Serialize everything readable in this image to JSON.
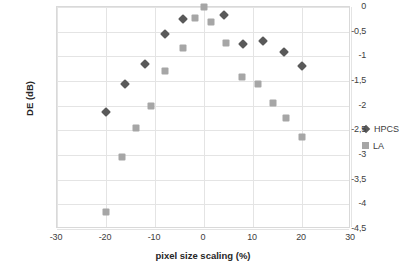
{
  "chart_data": {
    "type": "scatter",
    "title": "",
    "xlabel": "pixel size scaling  (%)",
    "ylabel": "DE (dB)",
    "xlim": [
      -30,
      30
    ],
    "ylim": [
      -4.5,
      0
    ],
    "grid": true,
    "legend_position": "right",
    "x_ticks": [
      "-30",
      "-20",
      "-10",
      "0",
      "10",
      "20",
      "30"
    ],
    "x_tick_values": [
      -30,
      -20,
      -10,
      0,
      10,
      20,
      30
    ],
    "y_ticks": [
      "0",
      "-0,5",
      "-1",
      "-1,5",
      "-2",
      "-2,5",
      "-3",
      "-3,5",
      "-4",
      "-4,5"
    ],
    "y_tick_values": [
      0,
      -0.5,
      -1,
      -1.5,
      -2,
      -2.5,
      -3,
      -3.5,
      -4,
      -4.5
    ],
    "series": [
      {
        "name": "HPCS",
        "marker": "diamond",
        "color": "#595959",
        "points": [
          [
            -20.0,
            -2.13
          ],
          [
            -16.2,
            -1.57
          ],
          [
            -12.0,
            -1.16
          ],
          [
            -8.0,
            -0.55
          ],
          [
            -4.2,
            -0.25
          ],
          [
            4.0,
            -0.17
          ],
          [
            8.0,
            -0.75
          ],
          [
            12.0,
            -0.68
          ],
          [
            16.3,
            -0.92
          ],
          [
            20.0,
            -1.2
          ]
        ]
      },
      {
        "name": "LA",
        "marker": "square",
        "color": "#a6a6a6",
        "points": [
          [
            -20.0,
            -4.15
          ],
          [
            -16.8,
            -3.05
          ],
          [
            -13.8,
            -2.46
          ],
          [
            -10.8,
            -2.0
          ],
          [
            -8.0,
            -1.3
          ],
          [
            -4.3,
            -0.84
          ],
          [
            -1.8,
            -0.23
          ],
          [
            0.0,
            0.0
          ],
          [
            1.5,
            -0.3
          ],
          [
            4.5,
            -0.73
          ],
          [
            7.8,
            -1.42
          ],
          [
            11.0,
            -1.57
          ],
          [
            14.0,
            -1.94
          ],
          [
            16.8,
            -2.25
          ],
          [
            20.0,
            -2.64
          ]
        ]
      }
    ]
  },
  "legend": {
    "entries": [
      {
        "label": "HPCS",
        "marker": "diamond-icon"
      },
      {
        "label": "LA",
        "marker": "square-icon"
      }
    ]
  }
}
